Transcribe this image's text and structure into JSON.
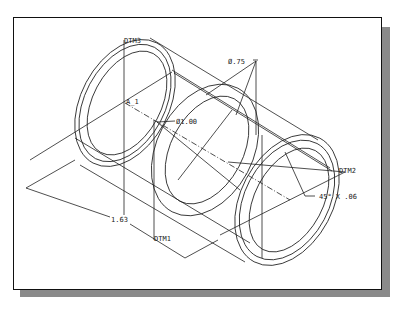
{
  "figure": {
    "type": "isometric-wireframe-drawing"
  },
  "labels": {
    "datum_top": "DTM3",
    "datum_right": "DTM2",
    "datum_bottom": "DTM1",
    "axis": "A_1",
    "outer_diameter": "Ø.75",
    "inner_diameter": "Ø1.00",
    "chamfer": "45° X .06",
    "length": "1.63"
  },
  "colors": {
    "line": "#222222",
    "frame": "#111111",
    "shadow": "#8a8a8a",
    "background": "#ffffff"
  }
}
